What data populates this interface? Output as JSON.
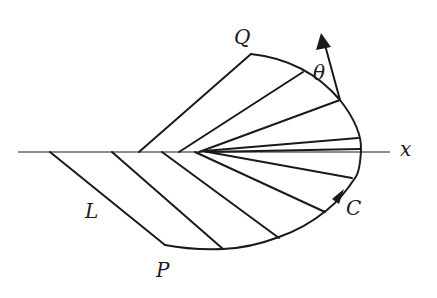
{
  "diagram": {
    "title": "",
    "labels": {
      "Q": "Q",
      "P": "P",
      "L": "L",
      "C": "C",
      "x": "x",
      "theta": "θ"
    },
    "axis": {
      "y": 152,
      "x_start": 18,
      "x_end": 390,
      "name": "x"
    },
    "curve_C": {
      "points": [
        [
          251,
          54
        ],
        [
          303,
          72
        ],
        [
          340,
          100
        ],
        [
          358,
          138
        ],
        [
          361,
          150
        ],
        [
          355,
          178
        ],
        [
          327,
          210
        ],
        [
          279,
          237
        ],
        [
          223,
          249
        ],
        [
          165,
          245
        ]
      ],
      "start_label": "Q",
      "end_label": "P"
    },
    "rays_upper": [
      [
        [
          139,
          152
        ],
        [
          251,
          54
        ]
      ],
      [
        [
          179,
          152
        ],
        [
          303,
          72
        ]
      ],
      [
        [
          199,
          152
        ],
        [
          340,
          100
        ]
      ],
      [
        [
          204,
          151
        ],
        [
          358,
          138
        ]
      ],
      [
        [
          206,
          152
        ],
        [
          358,
          150
        ]
      ]
    ],
    "rays_lower": [
      [
        [
          208,
          152
        ],
        [
          352,
          178
        ]
      ],
      [
        [
          195,
          152
        ],
        [
          325,
          212
        ]
      ],
      [
        [
          162,
          152
        ],
        [
          279,
          238
        ]
      ],
      [
        [
          112,
          152
        ],
        [
          223,
          249
        ]
      ],
      [
        [
          50,
          152
        ],
        [
          165,
          245
        ]
      ]
    ],
    "vector": {
      "from": [
        340,
        100
      ],
      "to": [
        322,
        34
      ],
      "angle_label": "θ"
    },
    "direction_arrow_on_C": {
      "at": [
        340,
        196
      ]
    },
    "colors": {
      "stroke": "#1a1a1a",
      "background": "#ffffff"
    }
  }
}
